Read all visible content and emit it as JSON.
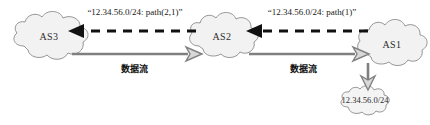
{
  "figure": {
    "background_color": "#ffffff",
    "cloud_fill": "#f2f2f2",
    "cloud_stroke": "#8a8a8a",
    "data_arrow_color": "#808080",
    "advert_arrow_color": "#111111"
  },
  "nodes": {
    "as3": {
      "label": "AS3"
    },
    "as2": {
      "label": "AS2"
    },
    "as1": {
      "label": "AS1"
    },
    "subnet": {
      "label": "12.34.56.0/24"
    }
  },
  "advertisements": [
    {
      "id": "as2-to-as3",
      "label": "“12.34.56.0/24: path(2,1)”",
      "direction": "right-to-left"
    },
    {
      "id": "as1-to-as2",
      "label": "“12.34.56.0/24: path(1)”",
      "direction": "right-to-left"
    }
  ],
  "data_flows": [
    {
      "id": "as3-to-as2",
      "label": "数据流",
      "direction": "left-to-right"
    },
    {
      "id": "as2-to-as1",
      "label": "数据流",
      "direction": "left-to-right"
    }
  ],
  "delivery": {
    "id": "as1-to-subnet",
    "direction": "top-to-bottom"
  }
}
